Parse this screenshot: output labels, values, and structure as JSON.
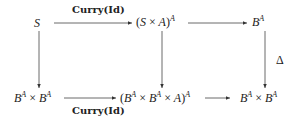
{
  "diagram": {
    "type": "commutative-diagram",
    "nodes": {
      "top_left": {
        "base": "S"
      },
      "top_middle": {
        "open": "(",
        "a": "S",
        "times": "×",
        "b": "A",
        "close": ")",
        "exp": "A"
      },
      "top_right": {
        "base": "B",
        "exp": "A"
      },
      "bottom_left": {
        "b1": "B",
        "e1": "A",
        "times": "×",
        "b2": "B",
        "e2": "A"
      },
      "bottom_middle": {
        "open": "(",
        "b1": "B",
        "e1": "A",
        "t1": "×",
        "b2": "B",
        "e2": "A",
        "t2": "×",
        "a": "A",
        "close": ")",
        "exp": "A"
      },
      "bottom_right": {
        "b1": "B",
        "e1": "A",
        "times": "×",
        "b2": "B",
        "e2": "A"
      }
    },
    "edges": {
      "top_left_to_top_middle": {
        "label": "Curry(Id)"
      },
      "top_middle_to_top_right": {
        "label": ""
      },
      "top_right_to_bottom_right": {
        "label": "Δ"
      },
      "top_left_to_bottom_left": {
        "label": ""
      },
      "top_middle_to_bottom_middle": {
        "label": ""
      },
      "bottom_left_to_bottom_middle": {
        "label": "Curry(Id)"
      },
      "bottom_middle_to_bottom_right": {
        "label": ""
      }
    }
  }
}
